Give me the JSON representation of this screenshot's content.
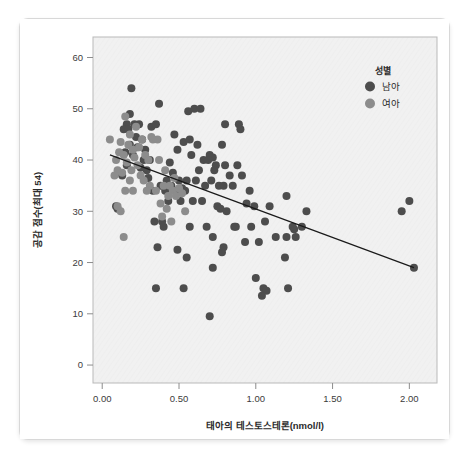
{
  "card": {
    "name": "chart-card"
  },
  "chart_data": {
    "type": "scatter",
    "title": "",
    "xlabel": "태아의 테스토스테론(nmol/l)",
    "ylabel": "공감 점수(최대 54)",
    "xlim": [
      -0.06,
      2.18
    ],
    "ylim": [
      -3.5,
      64
    ],
    "xticks": [
      0.0,
      0.5,
      1.0,
      1.5,
      2.0
    ],
    "xticklabels": [
      "0.00",
      "0.50",
      "1.00",
      "1.50",
      "2.00"
    ],
    "yticks": [
      0,
      10,
      20,
      30,
      40,
      50,
      60
    ],
    "yticklabels": [
      "0",
      "10",
      "20",
      "30",
      "40",
      "50",
      "60"
    ],
    "grid": false,
    "legend": {
      "title": "성별",
      "position": "top-right",
      "entries": [
        {
          "label": "남아",
          "color": "#4d4d4d"
        },
        {
          "label": "여아",
          "color": "#8c8c8c"
        }
      ]
    },
    "fit_line": {
      "label": "선형 적합선",
      "color": "#1a1a1a",
      "x0": 0.05,
      "y0": 41.0,
      "x1": 2.03,
      "y1": 19.0
    },
    "series": [
      {
        "name": "남아",
        "color": "#4d4d4d",
        "points": [
          [
            0.19,
            54.0
          ],
          [
            0.37,
            51.0
          ],
          [
            0.18,
            49.0
          ],
          [
            0.56,
            49.5
          ],
          [
            0.6,
            50.0
          ],
          [
            0.64,
            50.0
          ],
          [
            0.16,
            47.0
          ],
          [
            0.21,
            47.0
          ],
          [
            0.24,
            47.0
          ],
          [
            0.32,
            46.5
          ],
          [
            0.35,
            47.0
          ],
          [
            0.47,
            45.0
          ],
          [
            0.8,
            47.0
          ],
          [
            0.89,
            47.0
          ],
          [
            0.9,
            46.0
          ],
          [
            0.14,
            46.0
          ],
          [
            0.17,
            46.0
          ],
          [
            0.22,
            44.5
          ],
          [
            0.26,
            44.0
          ],
          [
            0.53,
            43.5
          ],
          [
            0.57,
            44.0
          ],
          [
            0.62,
            43.0
          ],
          [
            0.78,
            43.0
          ],
          [
            0.18,
            43.0
          ],
          [
            0.23,
            42.5
          ],
          [
            0.28,
            42.0
          ],
          [
            0.49,
            42.0
          ],
          [
            0.58,
            41.0
          ],
          [
            0.7,
            41.0
          ],
          [
            0.72,
            40.5
          ],
          [
            0.15,
            41.5
          ],
          [
            0.2,
            41.0
          ],
          [
            0.27,
            40.0
          ],
          [
            0.31,
            40.0
          ],
          [
            0.44,
            39.5
          ],
          [
            0.66,
            40.0
          ],
          [
            0.69,
            40.0
          ],
          [
            0.74,
            39.0
          ],
          [
            0.8,
            39.0
          ],
          [
            0.88,
            39.0
          ],
          [
            0.16,
            39.0
          ],
          [
            0.25,
            38.5
          ],
          [
            0.29,
            38.0
          ],
          [
            0.46,
            37.5
          ],
          [
            0.63,
            38.0
          ],
          [
            0.73,
            38.0
          ],
          [
            0.83,
            37.0
          ],
          [
            0.91,
            37.0
          ],
          [
            0.13,
            37.0
          ],
          [
            0.3,
            36.5
          ],
          [
            0.42,
            36.0
          ],
          [
            0.5,
            36.0
          ],
          [
            0.55,
            36.0
          ],
          [
            0.61,
            36.0
          ],
          [
            0.71,
            36.0
          ],
          [
            0.38,
            35.0
          ],
          [
            0.45,
            35.0
          ],
          [
            0.52,
            34.5
          ],
          [
            0.67,
            35.0
          ],
          [
            0.76,
            35.0
          ],
          [
            0.79,
            35.0
          ],
          [
            0.85,
            35.0
          ],
          [
            0.33,
            34.0
          ],
          [
            0.41,
            34.0
          ],
          [
            0.48,
            34.0
          ],
          [
            0.54,
            34.0
          ],
          [
            0.96,
            34.0
          ],
          [
            1.2,
            33.0
          ],
          [
            0.43,
            32.0
          ],
          [
            0.51,
            32.0
          ],
          [
            0.59,
            32.0
          ],
          [
            0.65,
            32.0
          ],
          [
            1.95,
            30.0
          ],
          [
            2.0,
            32.0
          ],
          [
            1.33,
            30.0
          ],
          [
            0.99,
            31.0
          ],
          [
            1.09,
            31.0
          ],
          [
            0.75,
            31.0
          ],
          [
            0.77,
            30.5
          ],
          [
            0.81,
            30.0
          ],
          [
            0.09,
            31.0
          ],
          [
            0.1,
            30.5
          ],
          [
            0.34,
            28.0
          ],
          [
            0.39,
            28.0
          ],
          [
            0.68,
            27.0
          ],
          [
            0.86,
            27.0
          ],
          [
            1.06,
            28.0
          ],
          [
            1.24,
            27.0
          ],
          [
            1.3,
            27.0
          ],
          [
            1.25,
            26.5
          ],
          [
            0.4,
            27.0
          ],
          [
            0.57,
            27.0
          ],
          [
            0.93,
            24.0
          ],
          [
            1.13,
            25.0
          ],
          [
            1.2,
            25.0
          ],
          [
            1.26,
            25.0
          ],
          [
            0.72,
            25.0
          ],
          [
            0.36,
            23.0
          ],
          [
            0.49,
            22.5
          ],
          [
            0.78,
            22.0
          ],
          [
            0.79,
            23.0
          ],
          [
            0.55,
            21.0
          ],
          [
            1.19,
            21.0
          ],
          [
            0.72,
            19.0
          ],
          [
            2.03,
            19.0
          ],
          [
            1.0,
            17.0
          ],
          [
            0.35,
            15.0
          ],
          [
            0.53,
            15.0
          ],
          [
            1.05,
            15.0
          ],
          [
            1.07,
            14.5
          ],
          [
            1.21,
            15.0
          ],
          [
            1.04,
            13.5
          ],
          [
            0.7,
            9.5
          ],
          [
            0.87,
            27.0
          ],
          [
            1.02,
            24.0
          ],
          [
            0.94,
            31.5
          ],
          [
            0.97,
            27.0
          ]
        ]
      },
      {
        "name": "여아",
        "color": "#8c8c8c",
        "points": [
          [
            0.15,
            48.5
          ],
          [
            0.22,
            46.5
          ],
          [
            0.18,
            45.0
          ],
          [
            0.26,
            44.0
          ],
          [
            0.05,
            44.0
          ],
          [
            0.12,
            43.5
          ],
          [
            0.17,
            43.0
          ],
          [
            0.24,
            42.5
          ],
          [
            0.2,
            42.0
          ],
          [
            0.28,
            41.0
          ],
          [
            0.11,
            41.5
          ],
          [
            0.14,
            41.0
          ],
          [
            0.21,
            40.5
          ],
          [
            0.3,
            40.0
          ],
          [
            0.33,
            44.0
          ],
          [
            0.36,
            44.0
          ],
          [
            0.09,
            40.0
          ],
          [
            0.16,
            39.5
          ],
          [
            0.23,
            39.0
          ],
          [
            0.19,
            38.0
          ],
          [
            0.1,
            38.0
          ],
          [
            0.13,
            37.5
          ],
          [
            0.25,
            37.0
          ],
          [
            0.27,
            36.0
          ],
          [
            0.08,
            37.0
          ],
          [
            0.31,
            35.0
          ],
          [
            0.4,
            35.0
          ],
          [
            0.44,
            35.0
          ],
          [
            0.46,
            34.0
          ],
          [
            0.5,
            34.5
          ],
          [
            0.29,
            34.0
          ],
          [
            0.35,
            34.0
          ],
          [
            0.52,
            33.5
          ],
          [
            0.15,
            34.0
          ],
          [
            0.2,
            34.0
          ],
          [
            0.43,
            33.0
          ],
          [
            0.48,
            33.0
          ],
          [
            0.38,
            31.5
          ],
          [
            0.42,
            30.5
          ],
          [
            0.1,
            31.0
          ],
          [
            0.12,
            30.0
          ],
          [
            0.39,
            29.0
          ],
          [
            0.45,
            28.0
          ],
          [
            0.54,
            30.0
          ],
          [
            0.14,
            25.0
          ],
          [
            0.32,
            44.5
          ],
          [
            0.37,
            40.0
          ],
          [
            0.41,
            38.0
          ],
          [
            0.47,
            36.5
          ],
          [
            0.18,
            36.0
          ]
        ]
      }
    ]
  }
}
